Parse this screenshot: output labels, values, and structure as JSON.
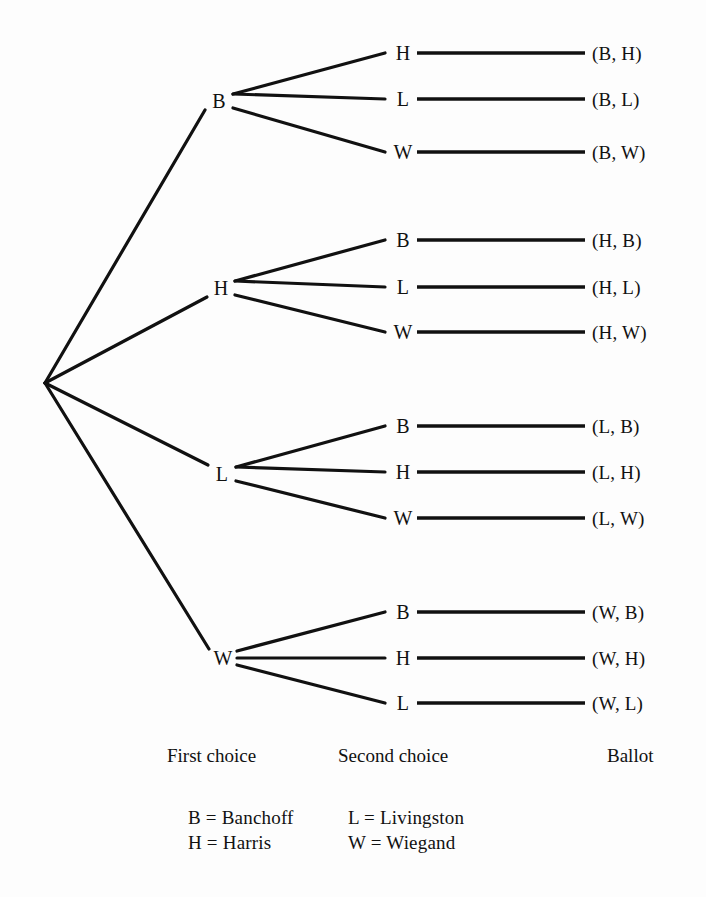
{
  "diagram": {
    "type": "probability-tree",
    "title_visible": false,
    "root": {
      "x": 45,
      "y": 383
    },
    "columns": [
      {
        "key": "first_choice",
        "caption": "First choice",
        "caption_x": 167,
        "caption_y": 755
      },
      {
        "key": "second_choice",
        "caption": "Second choice",
        "caption_x": 338,
        "caption_y": 755
      },
      {
        "key": "ballot",
        "caption": "Ballot",
        "caption_x": 607,
        "caption_y": 755
      }
    ],
    "level1": [
      {
        "label": "B",
        "x": 219,
        "y": 101
      },
      {
        "label": "H",
        "x": 221,
        "y": 288
      },
      {
        "label": "L",
        "x": 222,
        "y": 474
      },
      {
        "label": "W",
        "x": 223,
        "y": 658
      }
    ],
    "level2": [
      {
        "parent": "B",
        "label": "H",
        "x": 403,
        "y": 53,
        "ballot": "(B, H)",
        "ballot_x": 592
      },
      {
        "parent": "B",
        "label": "L",
        "x": 403,
        "y": 99,
        "ballot": "(B, L)",
        "ballot_x": 592
      },
      {
        "parent": "B",
        "label": "W",
        "x": 403,
        "y": 152,
        "ballot": "(B, W)",
        "ballot_x": 592
      },
      {
        "parent": "H",
        "label": "B",
        "x": 403,
        "y": 240,
        "ballot": "(H, B)",
        "ballot_x": 592
      },
      {
        "parent": "H",
        "label": "L",
        "x": 403,
        "y": 287,
        "ballot": "(H, L)",
        "ballot_x": 592
      },
      {
        "parent": "H",
        "label": "W",
        "x": 403,
        "y": 332,
        "ballot": "(H, W)",
        "ballot_x": 592
      },
      {
        "parent": "L",
        "label": "B",
        "x": 403,
        "y": 426,
        "ballot": "(L, B)",
        "ballot_x": 592
      },
      {
        "parent": "L",
        "label": "H",
        "x": 403,
        "y": 472,
        "ballot": "(L, H)",
        "ballot_x": 592
      },
      {
        "parent": "L",
        "label": "W",
        "x": 403,
        "y": 518,
        "ballot": "(L, W)",
        "ballot_x": 592
      },
      {
        "parent": "W",
        "label": "B",
        "x": 403,
        "y": 612,
        "ballot": "(W, B)",
        "ballot_x": 592
      },
      {
        "parent": "W",
        "label": "H",
        "x": 403,
        "y": 658,
        "ballot": "(W, H)",
        "ballot_x": 592
      },
      {
        "parent": "W",
        "label": "L",
        "x": 403,
        "y": 703,
        "ballot": "(W, L)",
        "ballot_x": 592
      }
    ],
    "legend": {
      "rows": [
        {
          "left": "B  =  Banchoff",
          "right": "L  =  Livingston"
        },
        {
          "left": "H  =  Harris",
          "right": "W  =  Wiegand"
        }
      ],
      "x": 353,
      "y": 805
    },
    "colors": {
      "ink": "#111111",
      "paper": "#fdfdfd"
    }
  },
  "chart_data": {
    "type": "table",
    "stages": [
      "First choice",
      "Second choice",
      "Ballot"
    ],
    "candidates": {
      "B": "Banchoff",
      "H": "Harris",
      "L": "Livingston",
      "W": "Wiegand"
    },
    "outcomes": [
      "(B, H)",
      "(B, L)",
      "(B, W)",
      "(H, B)",
      "(H, L)",
      "(H, W)",
      "(L, B)",
      "(L, H)",
      "(L, W)",
      "(W, B)",
      "(W, H)",
      "(W, L)"
    ],
    "outcome_count": 12
  }
}
